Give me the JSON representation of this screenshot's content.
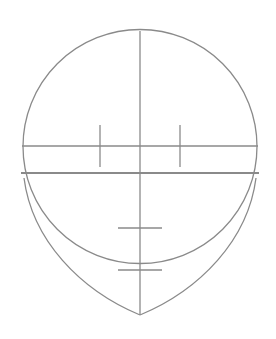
{
  "diagram": {
    "stroke_color": "#8a8a8a",
    "background": "#ffffff",
    "cranium_circle": {
      "cx": 140,
      "cy": 146.5,
      "r": 117
    },
    "center_line": {
      "x": 140,
      "y1": 31,
      "y2": 315
    },
    "eye_line": {
      "y": 146,
      "x1": 21,
      "x2": 259
    },
    "eye_ticks": [
      {
        "x": 100,
        "y1": 125,
        "y2": 167
      },
      {
        "x": 180,
        "y1": 125,
        "y2": 167
      }
    ],
    "brow_line": {
      "y": 173,
      "x1": 21,
      "x2": 259
    },
    "nose_tick": {
      "y": 228,
      "x1": 118,
      "x2": 162
    },
    "mouth_tick": {
      "y": 270,
      "x1": 118,
      "x2": 162
    },
    "chin_point": {
      "x": 140,
      "y": 315
    }
  }
}
